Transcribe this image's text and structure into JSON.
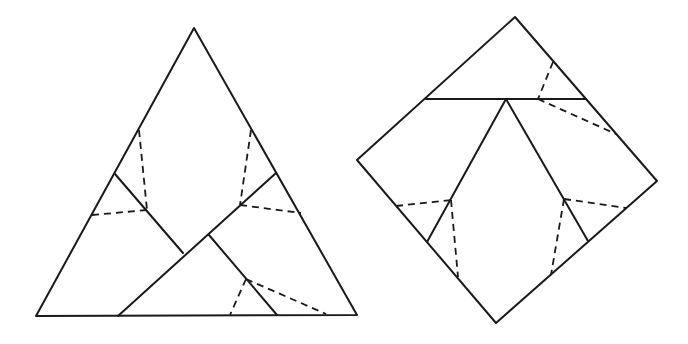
{
  "canvas": {
    "width": 688,
    "height": 344,
    "background": "#ffffff",
    "stroke": "#1a1a1a"
  },
  "figures": [
    {
      "name": "dissected-triangle",
      "outline": [
        [
          194,
          28
        ],
        [
          36,
          316
        ],
        [
          357,
          315
        ]
      ],
      "solid_segments": [
        [
          [
            115,
            174
          ],
          [
            183,
            253
          ]
        ],
        [
          [
            276,
            173
          ],
          [
            118,
            316
          ]
        ],
        [
          [
            209,
            235
          ],
          [
            277,
            315
          ]
        ]
      ],
      "dashed_segments": [
        [
          [
            139,
            130
          ],
          [
            147,
            210
          ]
        ],
        [
          [
            92,
            215
          ],
          [
            147,
            210
          ]
        ],
        [
          [
            251,
            130
          ],
          [
            240,
            205
          ]
        ],
        [
          [
            240,
            205
          ],
          [
            301,
            213
          ]
        ],
        [
          [
            246,
            279
          ],
          [
            230,
            315
          ]
        ],
        [
          [
            246,
            279
          ],
          [
            326,
            314
          ]
        ]
      ]
    },
    {
      "name": "dissected-square",
      "outline": [
        [
          515,
          17
        ],
        [
          357,
          160
        ],
        [
          496,
          323
        ],
        [
          657,
          181
        ]
      ],
      "solid_segments": [
        [
          [
            426,
            99
          ],
          [
            586,
            99
          ]
        ],
        [
          [
            506,
            99
          ],
          [
            427,
            242
          ]
        ],
        [
          [
            506,
            99
          ],
          [
            588,
            241
          ]
        ]
      ],
      "dashed_segments": [
        [
          [
            553,
            62
          ],
          [
            538,
            99
          ]
        ],
        [
          [
            538,
            99
          ],
          [
            616,
            134
          ]
        ],
        [
          [
            396,
            206
          ],
          [
            451,
            200
          ]
        ],
        [
          [
            451,
            200
          ],
          [
            458,
            277
          ]
        ],
        [
          [
            564,
            199
          ],
          [
            626,
            208
          ]
        ],
        [
          [
            564,
            199
          ],
          [
            551,
            275
          ]
        ]
      ]
    }
  ]
}
